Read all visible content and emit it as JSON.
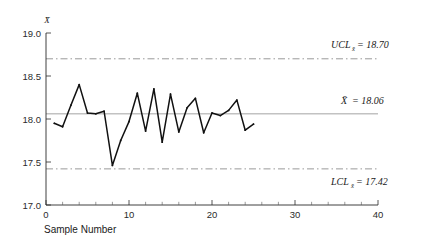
{
  "chart_data": {
    "type": "line",
    "title": "",
    "subtitle": "",
    "xlabel": "Sample Number",
    "ylabel": "x̄",
    "ylabel_display": "X̄",
    "xlim": [
      0,
      40
    ],
    "ylim": [
      17.0,
      19.0
    ],
    "grid": false,
    "legend_position": "none",
    "x_ticks": [
      0,
      10,
      20,
      30,
      40
    ],
    "x_tick_labels": [
      "0",
      "10",
      "20",
      "30",
      "40"
    ],
    "x_minor_tick_step": 2,
    "y_ticks": [
      17.0,
      17.5,
      18.0,
      18.5,
      19.0
    ],
    "y_tick_labels": [
      "17.0",
      "17.5",
      "18.0",
      "18.5",
      "19.0"
    ],
    "x": [
      1,
      2,
      3,
      4,
      5,
      6,
      7,
      8,
      9,
      10,
      11,
      12,
      13,
      14,
      15,
      16,
      17,
      18,
      19,
      20,
      21,
      22,
      23,
      24,
      25
    ],
    "values": [
      17.95,
      17.91,
      18.16,
      18.4,
      18.07,
      18.06,
      18.09,
      17.46,
      17.75,
      17.97,
      18.3,
      17.86,
      18.35,
      17.73,
      18.29,
      17.85,
      18.13,
      18.24,
      17.84,
      18.07,
      18.04,
      18.1,
      18.22,
      17.87,
      17.94
    ],
    "series": [
      {
        "name": "Sample mean",
        "values": [
          17.95,
          17.91,
          18.16,
          18.4,
          18.07,
          18.06,
          18.09,
          17.46,
          17.75,
          17.97,
          18.3,
          17.86,
          18.35,
          17.73,
          18.29,
          17.85,
          18.13,
          18.24,
          17.84,
          18.07,
          18.04,
          18.1,
          18.22,
          17.87,
          17.94
        ],
        "color": "#111111"
      }
    ],
    "reference_lines": [
      {
        "id": "ucl",
        "value": 18.7,
        "style": "dash-dot",
        "color": "#8d8d8d",
        "label_prefix": "UCL",
        "label_subscript": "x̄",
        "label_value": "18.70",
        "label_text": "UCL = 18.70"
      },
      {
        "id": "center",
        "value": 18.06,
        "style": "solid",
        "color": "#9a9a9a",
        "label_prefix": "X̄",
        "label_subscript": "",
        "label_value": "18.06",
        "label_text": "X̄ = 18.06"
      },
      {
        "id": "lcl",
        "value": 17.42,
        "style": "dash-dot",
        "color": "#8d8d8d",
        "label_prefix": "LCL",
        "label_subscript": "x̄",
        "label_value": "17.42",
        "label_text": "LCL = 17.42"
      }
    ]
  },
  "labels": {
    "y_axis_symbol": "X̄",
    "x_axis_title": "Sample Number",
    "ucl_prefix": "UCL",
    "ucl_sub": "x̄",
    "ucl_equals": "= 18.70",
    "center_prefix": "X̄",
    "center_equals": "= 18.06",
    "lcl_prefix": "LCL",
    "lcl_sub": "x̄",
    "lcl_equals": "= 17.42",
    "y_tick_0": "17.0",
    "y_tick_1": "17.5",
    "y_tick_2": "18.0",
    "y_tick_3": "18.5",
    "y_tick_4": "19.0",
    "x_tick_0": "0",
    "x_tick_1": "10",
    "x_tick_2": "20",
    "x_tick_3": "30",
    "x_tick_4": "40"
  },
  "colors": {
    "background": "#ffffff",
    "axis": "#2b2b2b",
    "data": "#111111",
    "center_line": "#9a9a9a",
    "limit_line": "#8d8d8d",
    "text": "#1a1a1a"
  }
}
